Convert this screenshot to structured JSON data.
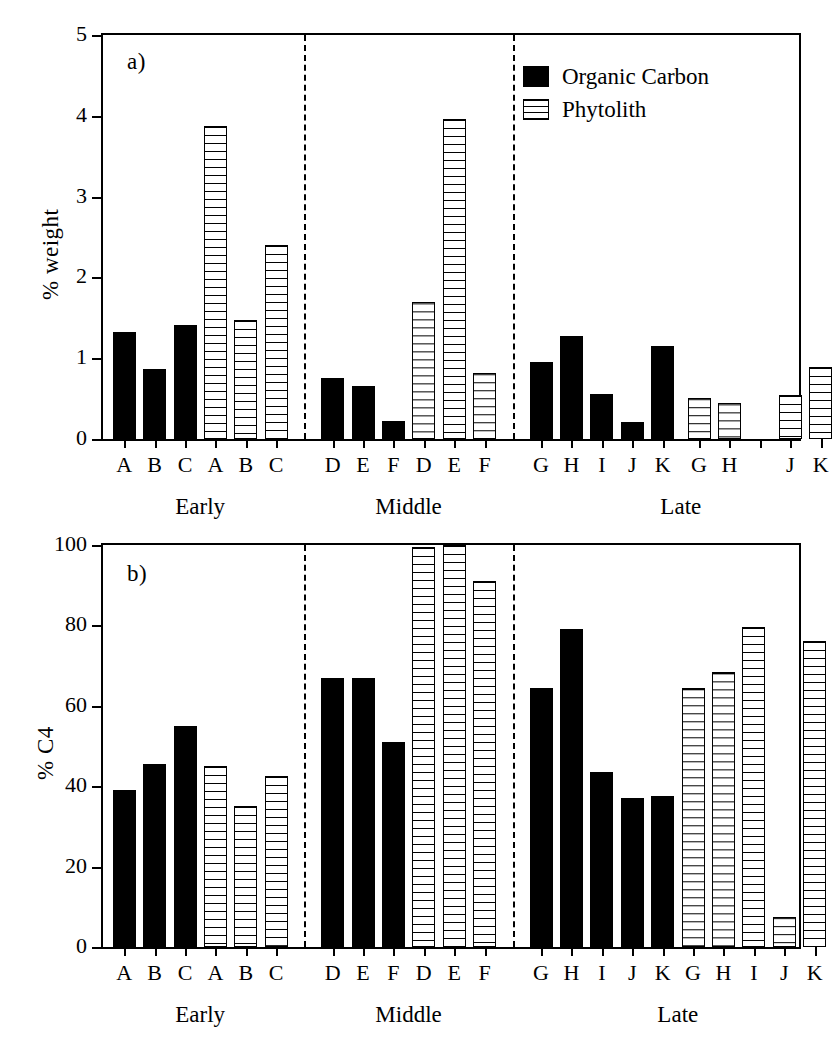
{
  "figure": {
    "legend": {
      "position": "top-right-panel-a",
      "entries": [
        {
          "label": "Organic Carbon",
          "style": "solid-black",
          "color": "#000000"
        },
        {
          "label": "Phytolith",
          "style": "white-horizontal-hatch",
          "color": "#ffffff"
        }
      ]
    },
    "group_labels": [
      "Early",
      "Middle",
      "Late"
    ]
  },
  "chart_data": [
    {
      "id": "panel-a",
      "type": "bar",
      "panel_letter": "a)",
      "title": "",
      "xlabel": "",
      "ylabel": "% weight",
      "ylim": [
        0,
        5
      ],
      "yticks": [
        0,
        1,
        2,
        3,
        4,
        5
      ],
      "ytick_labels": [
        "0",
        "1",
        "2",
        "3",
        "4",
        "5"
      ],
      "grid": false,
      "legend": [
        "Organic Carbon",
        "Phytolith"
      ],
      "groups": [
        "Early",
        "Middle",
        "Late"
      ],
      "categories": [
        "A",
        "B",
        "C",
        "A",
        "B",
        "C",
        "D",
        "E",
        "F",
        "D",
        "E",
        "F",
        "G",
        "H",
        "I",
        "J",
        "K",
        "G",
        "H",
        "",
        "J",
        "K"
      ],
      "series": [
        {
          "name": "Organic Carbon",
          "values": [
            1.33,
            0.87,
            1.41,
            null,
            null,
            null,
            0.75,
            0.66,
            0.22,
            null,
            null,
            null,
            0.95,
            1.27,
            0.56,
            0.21,
            1.15,
            null,
            null,
            null,
            null,
            null
          ]
        },
        {
          "name": "Phytolith",
          "values": [
            null,
            null,
            null,
            3.87,
            1.47,
            2.4,
            null,
            null,
            null,
            1.7,
            3.96,
            0.82,
            null,
            null,
            null,
            null,
            null,
            0.51,
            0.45,
            null,
            0.54,
            0.89
          ]
        }
      ],
      "notes": "Late-group phytolith has no bar for sample I; a gap appears between H and J."
    },
    {
      "id": "panel-b",
      "type": "bar",
      "panel_letter": "b)",
      "title": "",
      "xlabel": "",
      "ylabel": "% C4",
      "ylim": [
        0,
        100
      ],
      "yticks": [
        0,
        20,
        40,
        60,
        80,
        100
      ],
      "ytick_labels": [
        "0",
        "20",
        "40",
        "60",
        "80",
        "100"
      ],
      "grid": false,
      "legend": [
        "Organic Carbon",
        "Phytolith"
      ],
      "groups": [
        "Early",
        "Middle",
        "Late"
      ],
      "categories": [
        "A",
        "B",
        "C",
        "A",
        "B",
        "C",
        "D",
        "E",
        "F",
        "D",
        "E",
        "F",
        "G",
        "H",
        "I",
        "J",
        "K",
        "G",
        "H",
        "I",
        "J",
        "K"
      ],
      "series": [
        {
          "name": "Organic Carbon",
          "values": [
            39,
            45.5,
            55,
            null,
            null,
            null,
            67,
            67,
            51,
            null,
            null,
            null,
            64.5,
            79,
            43.5,
            37,
            37.5,
            null,
            null,
            null,
            null,
            null
          ]
        },
        {
          "name": "Phytolith",
          "values": [
            null,
            null,
            null,
            45,
            35,
            42.5,
            null,
            null,
            null,
            99.5,
            100,
            91,
            null,
            null,
            null,
            null,
            null,
            64.5,
            68.5,
            79.5,
            7.5,
            76
          ]
        }
      ]
    }
  ]
}
